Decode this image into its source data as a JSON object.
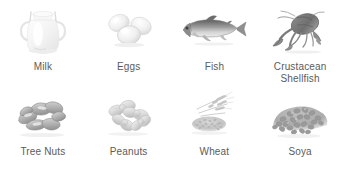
{
  "chart": {
    "background_color": "#ffffff",
    "label_color": "#5b5b5b",
    "columns": 4,
    "rows": 2
  },
  "allergens": [
    {
      "id": "milk",
      "label": "Milk",
      "icon": "milk-jug-icon",
      "row": 1,
      "column": 1,
      "tone": "#e9e9e9"
    },
    {
      "id": "eggs",
      "label": "Eggs",
      "icon": "eggs-icon",
      "row": 1,
      "column": 2,
      "tone": "#dcdcdc"
    },
    {
      "id": "fish",
      "label": "Fish",
      "icon": "fish-icon",
      "row": 1,
      "column": 3,
      "tone": "#9a9a9a"
    },
    {
      "id": "crustacean-shellfish",
      "label": "Crustacean\nShellfish",
      "icon": "crustacean-icon",
      "row": 1,
      "column": 4,
      "tone": "#8f8f8f"
    },
    {
      "id": "tree-nuts",
      "label": "Tree Nuts",
      "icon": "cashew-nuts-icon",
      "row": 2,
      "column": 1,
      "tone": "#b5b5b5"
    },
    {
      "id": "peanuts",
      "label": "Peanuts",
      "icon": "peanuts-icon",
      "row": 2,
      "column": 2,
      "tone": "#cfcfcf"
    },
    {
      "id": "wheat",
      "label": "Wheat",
      "icon": "wheat-grain-icon",
      "row": 2,
      "column": 3,
      "tone": "#c8c8c8"
    },
    {
      "id": "soya",
      "label": "Soya",
      "icon": "soya-beans-icon",
      "row": 2,
      "column": 4,
      "tone": "#b0b0b0"
    }
  ]
}
